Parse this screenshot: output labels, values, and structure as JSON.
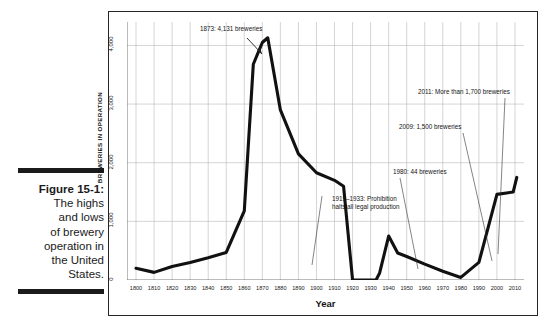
{
  "figure": {
    "caption_label": "Figure 15-1:",
    "caption_lines": [
      "The highs",
      "and lows",
      "of brewery",
      "operation in",
      "the United",
      "States."
    ]
  },
  "chart_data": {
    "type": "line",
    "title": "",
    "xlabel": "Year",
    "ylabel": "BREWERIES IN OPERATION",
    "xlim": [
      1795,
      2015
    ],
    "ylim": [
      0,
      4400
    ],
    "grid": true,
    "legend": "none",
    "x_ticks": [
      1800,
      1810,
      1820,
      1830,
      1840,
      1850,
      1860,
      1870,
      1880,
      1890,
      1900,
      1910,
      1920,
      1930,
      1940,
      1950,
      1960,
      1970,
      1980,
      1990,
      2000,
      2010
    ],
    "x_tick_labels": [
      "1800",
      "1810",
      "1820",
      "1830",
      "1840",
      "1850",
      "1860",
      "1870",
      "1880",
      "1890",
      "1900",
      "1910",
      "1920",
      "1930",
      "1940",
      "1950",
      "1960",
      "1970",
      "1980",
      "1990",
      "2000",
      "2010"
    ],
    "y_ticks": [
      0,
      1000,
      2000,
      3000,
      4000
    ],
    "y_tick_labels": [
      "0",
      "1,000",
      "2,000",
      "3,000",
      "4,000"
    ],
    "series": [
      {
        "name": "Breweries in operation",
        "color": "#111111",
        "x": [
          1800,
          1810,
          1820,
          1830,
          1840,
          1850,
          1860,
          1865,
          1870,
          1873,
          1880,
          1890,
          1900,
          1910,
          1915,
          1920,
          1933,
          1935,
          1940,
          1945,
          1950,
          1960,
          1970,
          1980,
          1990,
          2000,
          2009,
          2011
        ],
        "y": [
          200,
          130,
          230,
          300,
          380,
          470,
          1180,
          3680,
          4050,
          4131,
          2900,
          2150,
          1830,
          1700,
          1600,
          0,
          0,
          120,
          750,
          460,
          400,
          270,
          150,
          44,
          300,
          1460,
          1500,
          1750
        ]
      }
    ],
    "annotations": [
      {
        "id": "peak-1873",
        "text": "1873: 4,131 breweries",
        "x": 1873,
        "y": 4131
      },
      {
        "id": "prohibition",
        "text_lines": [
          "1919–1933: Prohibition",
          "halts all legal production"
        ],
        "x": 1927,
        "y": 0
      },
      {
        "id": "low-1980",
        "text": "1980: 44 breweries",
        "x": 1980,
        "y": 44
      },
      {
        "id": "count-2009",
        "text": "2009: 1,500 breweries",
        "x": 2009,
        "y": 1500
      },
      {
        "id": "count-2011",
        "text": "2011: More than 1,700 breweries",
        "x": 2011,
        "y": 1750
      }
    ]
  }
}
